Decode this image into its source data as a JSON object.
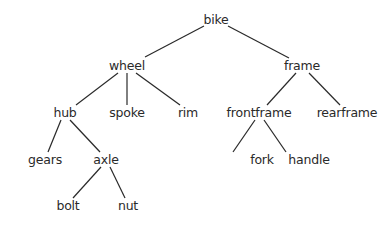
{
  "diagram": {
    "type": "tree",
    "root": "bike",
    "nodes": [
      {
        "id": "bike",
        "label": "bike",
        "x": 216,
        "y": 20
      },
      {
        "id": "wheel",
        "label": "wheel",
        "x": 127,
        "y": 66
      },
      {
        "id": "frame",
        "label": "frame",
        "x": 302,
        "y": 66
      },
      {
        "id": "hub",
        "label": "hub",
        "x": 65,
        "y": 113
      },
      {
        "id": "spoke",
        "label": "spoke",
        "x": 127,
        "y": 113
      },
      {
        "id": "rim",
        "label": "rim",
        "x": 188,
        "y": 113
      },
      {
        "id": "frontframe",
        "label": "frontframe",
        "x": 259,
        "y": 113
      },
      {
        "id": "rearframe",
        "label": "rearframe",
        "x": 347,
        "y": 113
      },
      {
        "id": "gears",
        "label": "gears",
        "x": 45,
        "y": 160
      },
      {
        "id": "axle",
        "label": "axle",
        "x": 106,
        "y": 160
      },
      {
        "id": "fork",
        "label": "fork",
        "x": 262,
        "y": 160
      },
      {
        "id": "handle",
        "label": "handle",
        "x": 309,
        "y": 160
      },
      {
        "id": "bolt",
        "label": "bolt",
        "x": 68,
        "y": 206
      },
      {
        "id": "nut",
        "label": "nut",
        "x": 128,
        "y": 206
      }
    ],
    "edges": [
      {
        "from": "bike",
        "to": "wheel",
        "x1": 204,
        "y1": 26,
        "x2": 145,
        "y2": 57
      },
      {
        "from": "bike",
        "to": "frame",
        "x1": 228,
        "y1": 26,
        "x2": 289,
        "y2": 58
      },
      {
        "from": "wheel",
        "to": "hub",
        "x1": 118,
        "y1": 73,
        "x2": 76,
        "y2": 105
      },
      {
        "from": "wheel",
        "to": "spoke",
        "x1": 127,
        "y1": 73,
        "x2": 127,
        "y2": 105
      },
      {
        "from": "wheel",
        "to": "rim",
        "x1": 136,
        "y1": 73,
        "x2": 180,
        "y2": 105
      },
      {
        "from": "frame",
        "to": "frontframe",
        "x1": 296,
        "y1": 73,
        "x2": 267,
        "y2": 105
      },
      {
        "from": "frame",
        "to": "rearframe",
        "x1": 309,
        "y1": 73,
        "x2": 340,
        "y2": 105
      },
      {
        "from": "hub",
        "to": "gears",
        "x1": 61,
        "y1": 120,
        "x2": 48,
        "y2": 152
      },
      {
        "from": "hub",
        "to": "axle",
        "x1": 70,
        "y1": 120,
        "x2": 100,
        "y2": 152
      },
      {
        "from": "axle",
        "to": "bolt",
        "x1": 101,
        "y1": 167,
        "x2": 73,
        "y2": 198
      },
      {
        "from": "axle",
        "to": "nut",
        "x1": 110,
        "y1": 167,
        "x2": 125,
        "y2": 198
      },
      {
        "from": "frontframe",
        "to": "fork",
        "x1": 255,
        "y1": 120,
        "x2": 233,
        "y2": 152
      },
      {
        "from": "frontframe",
        "to": "handle",
        "x1": 264,
        "y1": 120,
        "x2": 286,
        "y2": 152
      }
    ]
  },
  "colors": {
    "background": "#ffffff",
    "text": "#2a2a2a",
    "edge": "#2a2a2a"
  }
}
